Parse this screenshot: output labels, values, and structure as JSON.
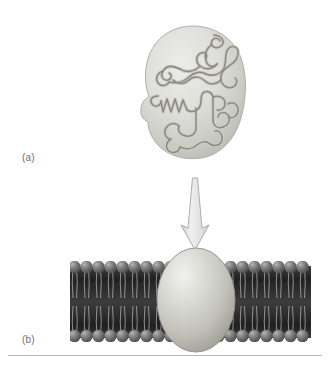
{
  "figure": {
    "background_color": "#ffffff",
    "width": 330,
    "height": 367
  },
  "labels": {
    "panel_a": "(a)",
    "panel_b": "(b)"
  },
  "panel_a": {
    "name": "folded globular protein",
    "blob": {
      "fill_light": "#e3e3e0",
      "fill_mid": "#cfcfca",
      "fill_dark": "#b8b8b2",
      "outline": "#b0b0a9",
      "center_x": 193,
      "center_y": 92,
      "radius_x": 48,
      "radius_y": 66
    },
    "polypeptide_chain": {
      "stroke": "#8e8e86",
      "stroke_highlight": "#c6c6bf",
      "stroke_width": 2.0,
      "features": [
        "alpha-helix",
        "random-coil",
        "hairpin-turn",
        "beta-strand",
        "loop"
      ]
    }
  },
  "arrow": {
    "name": "downward transition arrow",
    "fill": "#e2e2e2",
    "outline": "#a8a8a8",
    "from_y": 178,
    "to_y": 247,
    "x": 195
  },
  "panel_b": {
    "name": "protein embedded in phospholipid bilayer",
    "membrane": {
      "left_x": 70,
      "right_x": 311,
      "top_y": 262,
      "bottom_y": 341,
      "core_color_dark": "#2f2f2f",
      "core_color_mid": "#4a4a4a",
      "head_color": "#6f6f6f",
      "head_highlight": "#a9a9a9",
      "head_radius": 6.2,
      "tail_color": "#d8d8d8",
      "heads_per_leaflet": 20
    },
    "embedded_protein": {
      "fill_light": "#e8e8e4",
      "fill_mid": "#c9c9c3",
      "fill_dark": "#a4a49d",
      "outline": "#989891",
      "center_x": 196,
      "center_y": 300,
      "radius_x": 39,
      "radius_y": 52
    }
  },
  "rule": {
    "color": "#b9b9b9"
  }
}
